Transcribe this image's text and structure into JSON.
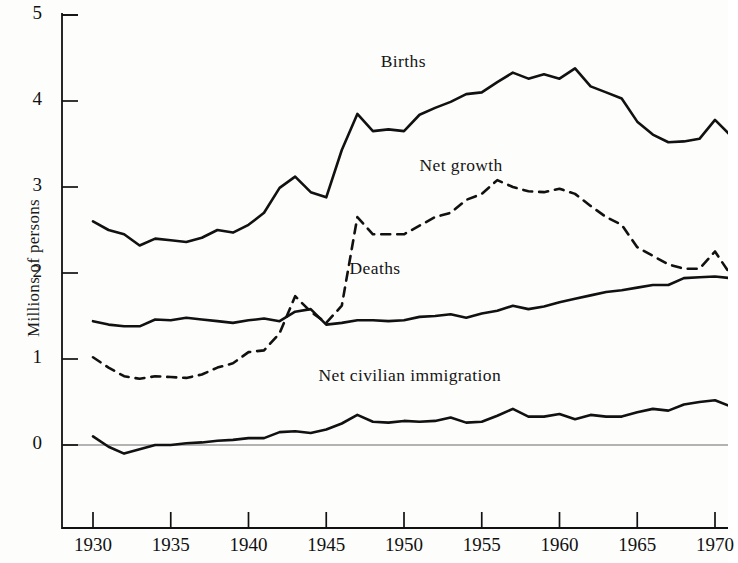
{
  "chart_data": {
    "type": "line",
    "title": "",
    "xlabel": "",
    "ylabel": "Millions of persons",
    "xlim": [
      1929,
      1972.5
    ],
    "ylim": [
      -1,
      5
    ],
    "xticks": [
      1930,
      1935,
      1940,
      1945,
      1950,
      1955,
      1960,
      1965,
      1970
    ],
    "xtick_labels": [
      "1930",
      "1935",
      "1940",
      "1945",
      "1950",
      "1955",
      "1960",
      "1965",
      "1970"
    ],
    "yticks": [
      0,
      1,
      2,
      3,
      4,
      5
    ],
    "ytick_labels": [
      "0",
      "1",
      "2",
      "3",
      "4",
      "5"
    ],
    "grid": false,
    "legend": "inline-labels",
    "x": [
      1930,
      1931,
      1932,
      1933,
      1934,
      1935,
      1936,
      1937,
      1938,
      1939,
      1940,
      1941,
      1942,
      1943,
      1944,
      1945,
      1946,
      1947,
      1948,
      1949,
      1950,
      1951,
      1952,
      1953,
      1954,
      1955,
      1956,
      1957,
      1958,
      1959,
      1960,
      1961,
      1962,
      1963,
      1964,
      1965,
      1966,
      1967,
      1968,
      1969,
      1970,
      1971,
      1972
    ],
    "series": [
      {
        "name": "Births",
        "style": "solid",
        "label_x": 1948.5,
        "label_y": 4.45,
        "values": [
          2.6,
          2.5,
          2.45,
          2.32,
          2.4,
          2.38,
          2.36,
          2.41,
          2.5,
          2.47,
          2.56,
          2.7,
          2.99,
          3.12,
          2.94,
          2.88,
          3.43,
          3.85,
          3.65,
          3.67,
          3.65,
          3.84,
          3.92,
          3.99,
          4.08,
          4.1,
          4.22,
          4.33,
          4.26,
          4.31,
          4.26,
          4.38,
          4.17,
          4.1,
          4.03,
          3.76,
          3.61,
          3.52,
          3.53,
          3.56,
          3.78,
          3.6,
          3.36
        ]
      },
      {
        "name": "Net growth",
        "style": "dashed",
        "label_x": 1951.0,
        "label_y": 3.25,
        "values": [
          1.02,
          0.9,
          0.8,
          0.77,
          0.8,
          0.79,
          0.78,
          0.82,
          0.9,
          0.95,
          1.08,
          1.1,
          1.3,
          1.73,
          1.55,
          1.42,
          1.62,
          2.65,
          2.45,
          2.45,
          2.45,
          2.55,
          2.65,
          2.7,
          2.85,
          2.92,
          3.08,
          3.0,
          2.95,
          2.94,
          2.98,
          2.92,
          2.78,
          2.65,
          2.56,
          2.3,
          2.2,
          2.1,
          2.05,
          2.05,
          2.25,
          1.98,
          1.85
        ]
      },
      {
        "name": "Deaths",
        "style": "solid",
        "label_x": 1946.5,
        "label_y": 2.05,
        "values": [
          1.44,
          1.4,
          1.38,
          1.38,
          1.46,
          1.45,
          1.48,
          1.46,
          1.44,
          1.42,
          1.45,
          1.47,
          1.44,
          1.55,
          1.58,
          1.4,
          1.42,
          1.45,
          1.45,
          1.44,
          1.45,
          1.49,
          1.5,
          1.52,
          1.48,
          1.53,
          1.56,
          1.62,
          1.58,
          1.61,
          1.66,
          1.7,
          1.74,
          1.78,
          1.8,
          1.83,
          1.86,
          1.86,
          1.94,
          1.95,
          1.96,
          1.94,
          1.98
        ]
      },
      {
        "name": "Net civilian immigration",
        "style": "solid",
        "label_x": 1944.5,
        "label_y": 0.8,
        "values": [
          0.1,
          -0.02,
          -0.1,
          -0.05,
          0.0,
          0.0,
          0.02,
          0.03,
          0.05,
          0.06,
          0.08,
          0.08,
          0.15,
          0.16,
          0.14,
          0.18,
          0.25,
          0.35,
          0.27,
          0.26,
          0.28,
          0.27,
          0.28,
          0.32,
          0.26,
          0.27,
          0.34,
          0.42,
          0.33,
          0.33,
          0.36,
          0.3,
          0.35,
          0.33,
          0.33,
          0.38,
          0.42,
          0.4,
          0.47,
          0.5,
          0.52,
          0.45,
          0.4
        ]
      }
    ]
  },
  "axis": {
    "y_title": "Millions of persons"
  },
  "labels": {
    "births": "Births",
    "net_growth": "Net growth",
    "deaths": "Deaths",
    "net_civilian_immigration": "Net civilian immigration"
  }
}
